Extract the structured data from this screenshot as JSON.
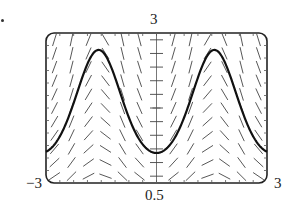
{
  "chart_data": {
    "type": "line",
    "subtype": "slope-field with solution curve",
    "title": "",
    "xlabel": "",
    "ylabel": "",
    "xlim": [
      -3,
      3
    ],
    "ylim": [
      0.5,
      3
    ],
    "tick_labels": {
      "x_min": "−3",
      "x_max": "3",
      "y_min": "0.5",
      "y_max": "3"
    },
    "grid": false,
    "series": [
      {
        "name": "solution curve",
        "x": [
          -3,
          -2.5,
          -2,
          -1.6,
          -1.2,
          -0.8,
          -0.4,
          0,
          0.4,
          0.8,
          1.2,
          1.6,
          2,
          2.5,
          3
        ],
        "values": [
          1.02,
          1.43,
          2.29,
          2.71,
          2.38,
          1.67,
          1.16,
          1.0,
          1.16,
          1.67,
          2.38,
          2.71,
          2.29,
          1.43,
          1.02
        ]
      }
    ],
    "slope_field": {
      "cols": 13,
      "rows": 11
    }
  },
  "labels": {
    "top": "3",
    "bottom": "0.5",
    "left": "−3",
    "right": "3"
  }
}
